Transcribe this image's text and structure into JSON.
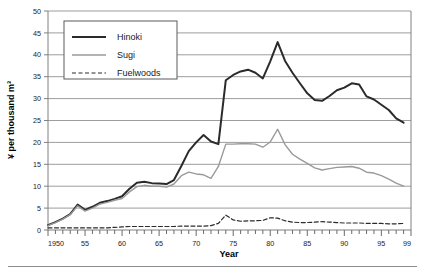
{
  "chart_data": {
    "type": "line",
    "title": "",
    "xlabel": "Year",
    "ylabel": "¥ per thousand m³",
    "xlim": [
      1950,
      1999
    ],
    "ylim": [
      0,
      50
    ],
    "grid": true,
    "legend_position": "top-left-inside",
    "y_ticks": [
      0,
      5,
      10,
      15,
      20,
      25,
      30,
      35,
      40,
      45,
      50
    ],
    "y_tick_labels": [
      "0",
      "5",
      "10",
      "15",
      "20",
      "25",
      "30",
      "35",
      "40",
      "45",
      "50"
    ],
    "x_ticks": [
      1950,
      1955,
      1960,
      1965,
      1970,
      1975,
      1980,
      1985,
      1990,
      1995,
      1999
    ],
    "x_tick_labels": [
      "1950",
      "55",
      "60",
      "65",
      "70",
      "75",
      "80",
      "85",
      "90",
      "95",
      "99"
    ],
    "x_minor_tick_interval": 1,
    "x": [
      1950,
      1951,
      1952,
      1953,
      1954,
      1955,
      1956,
      1957,
      1958,
      1959,
      1960,
      1961,
      1962,
      1963,
      1964,
      1965,
      1966,
      1967,
      1968,
      1969,
      1970,
      1971,
      1972,
      1973,
      1974,
      1975,
      1976,
      1977,
      1978,
      1979,
      1980,
      1981,
      1982,
      1983,
      1984,
      1985,
      1986,
      1987,
      1988,
      1989,
      1990,
      1991,
      1992,
      1993,
      1994,
      1995,
      1996,
      1997,
      1998
    ],
    "series": [
      {
        "name": "Hinoki",
        "color": "#2b2b2b",
        "style": "solid",
        "width": 2.0,
        "values": [
          1.1,
          1.8,
          2.6,
          3.6,
          5.8,
          4.6,
          5.3,
          6.2,
          6.6,
          7.1,
          7.7,
          9.4,
          10.8,
          11.0,
          10.7,
          10.6,
          10.5,
          11.4,
          14.6,
          18.0,
          20.0,
          21.7,
          20.2,
          19.6,
          34.2,
          35.4,
          36.2,
          36.6,
          35.9,
          34.6,
          38.5,
          42.9,
          38.6,
          35.9,
          33.5,
          31.2,
          29.7,
          29.5,
          30.6,
          31.9,
          32.5,
          33.5,
          33.2,
          30.5,
          29.8,
          28.6,
          27.4,
          25.5,
          24.5
        ]
      },
      {
        "name": "Sugi",
        "color": "#9a9a9a",
        "style": "solid",
        "width": 1.4,
        "values": [
          1.0,
          1.7,
          2.5,
          3.5,
          5.5,
          4.3,
          5.0,
          5.9,
          6.3,
          6.8,
          7.2,
          8.7,
          9.9,
          10.2,
          10.0,
          10.0,
          9.8,
          10.5,
          12.4,
          13.2,
          12.8,
          12.6,
          11.8,
          14.5,
          19.6,
          19.6,
          19.7,
          19.7,
          19.6,
          18.9,
          20.1,
          23.0,
          19.5,
          17.3,
          16.2,
          15.2,
          14.2,
          13.7,
          14.0,
          14.3,
          14.4,
          14.5,
          14.1,
          13.2,
          13.0,
          12.4,
          11.6,
          10.7,
          10.0
        ]
      },
      {
        "name": "Fuelwoods",
        "color": "#2b2b2b",
        "style": "dashed",
        "width": 1.2,
        "values": [
          0.5,
          0.5,
          0.5,
          0.5,
          0.5,
          0.5,
          0.5,
          0.5,
          0.5,
          0.6,
          0.7,
          0.8,
          0.8,
          0.8,
          0.8,
          0.8,
          0.8,
          0.8,
          0.9,
          0.9,
          0.9,
          0.9,
          1.0,
          1.5,
          3.4,
          2.3,
          2.0,
          2.1,
          2.1,
          2.2,
          2.8,
          2.7,
          2.1,
          1.8,
          1.7,
          1.7,
          1.8,
          1.9,
          1.8,
          1.7,
          1.6,
          1.6,
          1.6,
          1.5,
          1.5,
          1.5,
          1.4,
          1.4,
          1.5
        ]
      }
    ]
  },
  "legend": {
    "entries": [
      {
        "label": "Hinoki",
        "swatch": "solid-dark-thick"
      },
      {
        "label": "Sugi",
        "swatch": "solid-gray"
      },
      {
        "label": "Fuelwoods",
        "swatch": "dashed-dark"
      }
    ]
  },
  "caption": {
    "ghost_text": ""
  }
}
